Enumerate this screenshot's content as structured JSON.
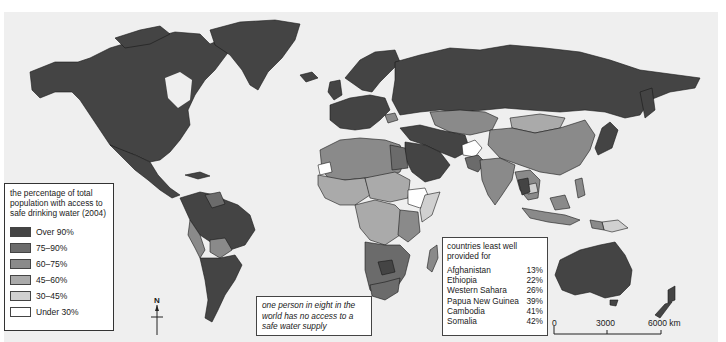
{
  "map": {
    "title": "World access to safe drinking water (2004)",
    "background_color": "#efefef",
    "ocean_color": "#efefef"
  },
  "legend": {
    "title": "the percentage of total population with access to safe drinking water (2004)",
    "items": [
      {
        "label": "Over 90%",
        "color": "#444444"
      },
      {
        "label": "75–90%",
        "color": "#6b6b6b"
      },
      {
        "label": "60–75%",
        "color": "#8a8a8a"
      },
      {
        "label": "45–60%",
        "color": "#aaaaaa"
      },
      {
        "label": "30–45%",
        "color": "#d0d0d0"
      },
      {
        "label": "Under 30%",
        "color": "#ffffff"
      }
    ]
  },
  "north_arrow": {
    "label": "N"
  },
  "fact_box": {
    "text": "one person in eight in the world has no access to a safe water supply"
  },
  "least_provided": {
    "title": "countries least well provided for",
    "rows": [
      {
        "country": "Afghanistan",
        "value": "13%"
      },
      {
        "country": "Ethiopia",
        "value": "22%"
      },
      {
        "country": "Western Sahara",
        "value": "26%"
      },
      {
        "country": "Papua New Guinea",
        "value": "39%"
      },
      {
        "country": "Cambodia",
        "value": "41%"
      },
      {
        "country": "Somalia",
        "value": "42%"
      }
    ]
  },
  "scale_bar": {
    "ticks": [
      "0",
      "3000",
      "6000 km"
    ]
  }
}
